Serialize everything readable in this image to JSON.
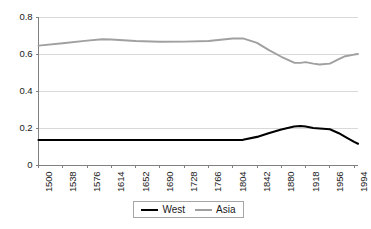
{
  "chart_data": {
    "type": "line",
    "title": "",
    "xlabel": "",
    "ylabel": "",
    "xlim": [
      1500,
      2000
    ],
    "ylim": [
      0,
      0.8
    ],
    "grid": true,
    "legend_position": "bottom-center",
    "y_ticks": [
      "0",
      "0.2",
      "0.4",
      "0.6",
      "0.8"
    ],
    "y_tick_values": [
      0,
      0.2,
      0.4,
      0.6,
      0.8
    ],
    "x_ticks": [
      "1500",
      "1538",
      "1576",
      "1614",
      "1652",
      "1690",
      "1728",
      "1766",
      "1804",
      "1842",
      "1880",
      "1918",
      "1956",
      "1994"
    ],
    "x_tick_values": [
      1500,
      1538,
      1576,
      1614,
      1652,
      1690,
      1728,
      1766,
      1804,
      1842,
      1880,
      1918,
      1956,
      1994
    ],
    "x": [
      1500,
      1538,
      1576,
      1600,
      1614,
      1652,
      1690,
      1728,
      1766,
      1804,
      1820,
      1842,
      1860,
      1880,
      1900,
      1910,
      1918,
      1930,
      1940,
      1956,
      1970,
      1980,
      1994,
      2000
    ],
    "series": [
      {
        "name": "West",
        "color": "#000000",
        "values": [
          0.135,
          0.135,
          0.135,
          0.135,
          0.135,
          0.135,
          0.135,
          0.135,
          0.135,
          0.135,
          0.136,
          0.152,
          0.172,
          0.192,
          0.208,
          0.211,
          0.208,
          0.2,
          0.197,
          0.193,
          0.172,
          0.152,
          0.125,
          0.115
        ]
      },
      {
        "name": "Asia",
        "color": "#a0a0a0",
        "values": [
          0.645,
          0.658,
          0.672,
          0.68,
          0.678,
          0.67,
          0.666,
          0.667,
          0.67,
          0.684,
          0.684,
          0.66,
          0.622,
          0.585,
          0.553,
          0.552,
          0.556,
          0.548,
          0.543,
          0.548,
          0.572,
          0.588,
          0.597,
          0.6
        ]
      }
    ]
  },
  "legend": {
    "items": [
      {
        "label": "West"
      },
      {
        "label": "Asia"
      }
    ]
  },
  "colors": {
    "west_line": "#000000",
    "asia_line": "#a0a0a0",
    "gridline": "#d9d9d9",
    "axis": "#808080",
    "background": "#ffffff"
  }
}
